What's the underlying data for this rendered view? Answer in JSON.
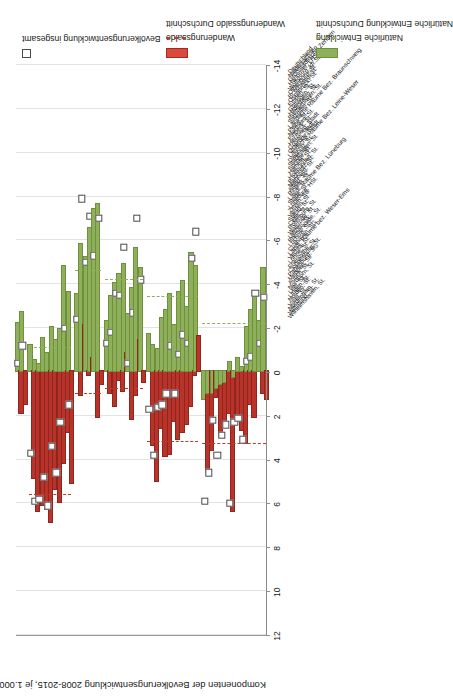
{
  "chart_data": {
    "type": "bar",
    "orientation": "vertical-rotated",
    "title": "Komponenten der Bevölkerungsentwicklung 2008-2015, je 1.000 Einwohner (Jahresdurchschnitt)",
    "ylabel": "Komponenten der Bevölkerungsentwicklung 2008-2015, je 1.000 Einwohner (Jahresdurchschnitt)",
    "xlabel": "",
    "ylim": [
      -14,
      12
    ],
    "tick_labels": [
      "12",
      "10",
      "8",
      "6",
      "4",
      "2",
      "0",
      "-2",
      "-4",
      "-6",
      "-8",
      "-10",
      "-12",
      "-14"
    ],
    "tick_values": [
      12,
      10,
      8,
      6,
      4,
      2,
      0,
      -2,
      -4,
      -6,
      -8,
      -10,
      -12,
      -14
    ],
    "grid": true,
    "legend_position": "right",
    "legend": [
      {
        "label": "Bevölkerungsentwicklung insgesamt",
        "marker": "open-square",
        "color": "#ffffff"
      },
      {
        "label": "Wanderungssaldo",
        "marker": "bar",
        "color": "#d94c3d"
      },
      {
        "label": "Wanderungssaldo Durchschnitt",
        "marker": "dashed-line",
        "color": "#c0392b"
      },
      {
        "label": "Natürliche Entwicklung",
        "marker": "bar",
        "color": "#8fb05a"
      },
      {
        "label": "Natürliche Entwicklung Durchschnitt",
        "marker": "dashed-line",
        "color": "#8fb05a"
      }
    ],
    "series": [
      {
        "name": "Wanderungssaldo",
        "color": "#b8342a"
      },
      {
        "name": "Natürliche Entwicklung",
        "color": "#8fb05a"
      },
      {
        "name": "Bevölkerungsentwicklung insgesamt",
        "color": "#ffffff"
      }
    ],
    "group_averages": [
      {
        "group": "Großstädtische Zentren",
        "wanderung": 5.6,
        "natuerlich": -1.1
      },
      {
        "group": "Ländliche Räume Bez. Braunschweig",
        "wanderung": 1.0,
        "natuerlich": -4.6
      },
      {
        "group": "Ländliche Räume Bez. Leine-Weser",
        "wanderung": 0.8,
        "natuerlich": -4.2
      },
      {
        "group": "Ländl. Räume Bez. Lüneburg",
        "wanderung": 3.2,
        "natuerlich": -3.4
      },
      {
        "group": "Ländl. Räume bez. Weser-Ems",
        "wanderung": 3.3,
        "natuerlich": -2.2
      }
    ],
    "categories": [
      {
        "label": "Deutschland",
        "group": false,
        "wanderung": 1.9,
        "natuerlich": -2.2,
        "gesamt": -0.4
      },
      {
        "label": "Niedersachsen",
        "group": false,
        "wanderung": 1.5,
        "natuerlich": -2.7,
        "gesamt": -1.2
      },
      {
        "label": "Großstädtische Zentren",
        "group": true,
        "wanderung": null,
        "natuerlich": null,
        "gesamt": null
      },
      {
        "label": "Hannover, LHSt.",
        "group": false,
        "wanderung": 4.9,
        "natuerlich": -1.2,
        "gesamt": 3.7
      },
      {
        "label": "Wolfsburg, kfr.St.",
        "group": false,
        "wanderung": 6.4,
        "natuerlich": -0.5,
        "gesamt": 5.9
      },
      {
        "label": "Oldenburg, St.",
        "group": false,
        "wanderung": 6.1,
        "natuerlich": -0.3,
        "gesamt": 5.8
      },
      {
        "label": "Br.schweig, St.",
        "group": false,
        "wanderung": 6.3,
        "natuerlich": -1.5,
        "gesamt": 4.8
      },
      {
        "label": "Osnabrück, St.",
        "group": false,
        "wanderung": 6.9,
        "natuerlich": -0.8,
        "gesamt": 6.1
      },
      {
        "label": "Emden, St.",
        "group": false,
        "wanderung": 5.4,
        "natuerlich": -2.0,
        "gesamt": 3.4
      },
      {
        "label": "Göttingen, St.",
        "group": false,
        "wanderung": 6.0,
        "natuerlich": -1.4,
        "gesamt": 4.6
      },
      {
        "label": "Hildesheim, St.",
        "group": false,
        "wanderung": 4.2,
        "natuerlich": -1.9,
        "gesamt": 2.3
      },
      {
        "label": "Bremerhaven, St.",
        "group": false,
        "wanderung": 2.8,
        "natuerlich": -4.8,
        "gesamt": -2.0
      },
      {
        "label": "Salzgitter, St.",
        "group": false,
        "wanderung": 5.1,
        "natuerlich": -3.6,
        "gesamt": 1.5
      },
      {
        "label": "Ländliche Räume Bez. Braunschweig",
        "group": true,
        "wanderung": null,
        "natuerlich": null,
        "gesamt": null
      },
      {
        "label": "Peine, St.",
        "group": false,
        "wanderung": 1.1,
        "natuerlich": -3.5,
        "gesamt": -2.4
      },
      {
        "label": "Northeim, St.",
        "group": false,
        "wanderung": -2.1,
        "natuerlich": -5.8,
        "gesamt": -7.9
      },
      {
        "label": "Einbeck, St.",
        "group": false,
        "wanderung": 0.2,
        "natuerlich": -5.2,
        "gesamt": -5.0
      },
      {
        "label": "Herzberg, Stadt",
        "group": false,
        "wanderung": -0.6,
        "natuerlich": -6.5,
        "gesamt": -7.1
      },
      {
        "label": "Goslar, Stadt",
        "group": false,
        "wanderung": 2.1,
        "natuerlich": -7.4,
        "gesamt": -5.3
      },
      {
        "label": "Osterode, Stadt",
        "group": false,
        "wanderung": 0.6,
        "natuerlich": -7.6,
        "gesamt": -7.0
      },
      {
        "label": "Ländliche Räume Bez. Leine-Weser",
        "group": true,
        "wanderung": null,
        "natuerlich": null,
        "gesamt": null
      },
      {
        "label": "Diepholz, St.",
        "group": false,
        "wanderung": 1.0,
        "natuerlich": -2.3,
        "gesamt": -1.3
      },
      {
        "label": "Stadthagen, St.",
        "group": false,
        "wanderung": 1.6,
        "natuerlich": -3.4,
        "gesamt": -1.8
      },
      {
        "label": "Springe, St.",
        "group": false,
        "wanderung": 0.4,
        "natuerlich": -4.0,
        "gesamt": -3.6
      },
      {
        "label": "Hameln, St.",
        "group": false,
        "wanderung": 0.9,
        "natuerlich": -4.4,
        "gesamt": -3.5
      },
      {
        "label": "Hofmunden, St.",
        "group": false,
        "wanderung": -0.8,
        "natuerlich": -4.9,
        "gesamt": -5.7
      },
      {
        "label": "Buchholz, St.",
        "group": false,
        "wanderung": 2.2,
        "natuerlich": -2.6,
        "gesamt": -0.4
      },
      {
        "label": "Nienburg, St.",
        "group": false,
        "wanderung": 1.1,
        "natuerlich": -3.8,
        "gesamt": -2.7
      },
      {
        "label": "Alfeld, St.",
        "group": false,
        "wanderung": -1.4,
        "natuerlich": -5.6,
        "gesamt": -7.0
      },
      {
        "label": "Rinteln, St.",
        "group": false,
        "wanderung": 0.5,
        "natuerlich": -4.7,
        "gesamt": -4.2
      },
      {
        "label": "Ländl. Räume Bez. Lüneburg",
        "group": true,
        "wanderung": null,
        "natuerlich": null,
        "gesamt": null
      },
      {
        "label": "Stade, St.",
        "group": false,
        "wanderung": 3.4,
        "natuerlich": -1.7,
        "gesamt": 1.7
      },
      {
        "label": "Lüneburg, HSt.",
        "group": false,
        "wanderung": 5.0,
        "natuerlich": -1.2,
        "gesamt": 3.8
      },
      {
        "label": "Zeven, SG",
        "group": false,
        "wanderung": 2.6,
        "natuerlich": -1.0,
        "gesamt": 1.6
      },
      {
        "label": "Verden, St.",
        "group": false,
        "wanderung": 3.9,
        "natuerlich": -2.4,
        "gesamt": 1.5
      },
      {
        "label": "Soltau, St.",
        "group": false,
        "wanderung": 3.8,
        "natuerlich": -2.8,
        "gesamt": 1.0
      },
      {
        "label": "Celle, St.",
        "group": false,
        "wanderung": 2.3,
        "natuerlich": -3.5,
        "gesamt": -1.2
      },
      {
        "label": "Rotenburg, St.",
        "group": false,
        "wanderung": 3.1,
        "natuerlich": -2.1,
        "gesamt": 1.0
      },
      {
        "label": "Walsrode, St.",
        "group": false,
        "wanderung": 2.8,
        "natuerlich": -3.6,
        "gesamt": -0.8
      },
      {
        "label": "Uelzen, St.",
        "group": false,
        "wanderung": 2.4,
        "natuerlich": -4.1,
        "gesamt": -1.7
      },
      {
        "label": "Bremervörde, St.",
        "group": false,
        "wanderung": 1.6,
        "natuerlich": -2.9,
        "gesamt": -1.3
      },
      {
        "label": "Lüchow, SG",
        "group": false,
        "wanderung": 0.2,
        "natuerlich": -5.4,
        "gesamt": -5.2
      },
      {
        "label": "Cuxhaven, SG",
        "group": false,
        "wanderung": -1.6,
        "natuerlich": -4.8,
        "gesamt": -6.4
      },
      {
        "label": "Ländl. Räume bez. Weser-Ems",
        "group": true,
        "wanderung": null,
        "natuerlich": null,
        "gesamt": null
      },
      {
        "label": "Vechta, St.",
        "group": false,
        "wanderung": 4.6,
        "natuerlich": 1.3,
        "gesamt": 5.9
      },
      {
        "label": "Lohne, St.",
        "group": false,
        "wanderung": 3.6,
        "natuerlich": 1.0,
        "gesamt": 4.6
      },
      {
        "label": "Friesoythe, St.",
        "group": false,
        "wanderung": 1.2,
        "natuerlich": 1.0,
        "gesamt": 2.2
      },
      {
        "label": "Cloppenburg, St.",
        "group": false,
        "wanderung": 3.0,
        "natuerlich": 0.8,
        "gesamt": 3.8
      },
      {
        "label": "Papenburg, SG",
        "group": false,
        "wanderung": 2.3,
        "natuerlich": 0.6,
        "gesamt": 2.9
      },
      {
        "label": "Meppen, St.",
        "group": false,
        "wanderung": 1.9,
        "natuerlich": 0.5,
        "gesamt": 2.4
      },
      {
        "label": "Aurich, St.",
        "group": false,
        "wanderung": 6.4,
        "natuerlich": -0.4,
        "gesamt": 6.0
      },
      {
        "label": "Nordhorn, St.",
        "group": false,
        "wanderung": 2.0,
        "natuerlich": 0.3,
        "gesamt": 2.3
      },
      {
        "label": "Leer, St.",
        "group": false,
        "wanderung": 2.7,
        "natuerlich": -0.6,
        "gesamt": 2.1
      },
      {
        "label": "Lingen, St.",
        "group": false,
        "wanderung": 3.3,
        "natuerlich": -0.2,
        "gesamt": 3.1
      },
      {
        "label": "Norden, St.",
        "group": false,
        "wanderung": 1.5,
        "natuerlich": -2.0,
        "gesamt": -0.5
      },
      {
        "label": "Varel, St.",
        "group": false,
        "wanderung": 2.1,
        "natuerlich": -2.8,
        "gesamt": -0.7
      },
      {
        "label": "Nordenham, St.",
        "group": false,
        "wanderung": -0.2,
        "natuerlich": -3.4,
        "gesamt": -3.6
      },
      {
        "label": "Wittmund, St.",
        "group": false,
        "wanderung": 1.0,
        "natuerlich": -2.3,
        "gesamt": -1.3
      },
      {
        "label": "Wilhelmshaven, St.",
        "group": false,
        "wanderung": 1.3,
        "natuerlich": -4.7,
        "gesamt": -3.4
      }
    ]
  }
}
